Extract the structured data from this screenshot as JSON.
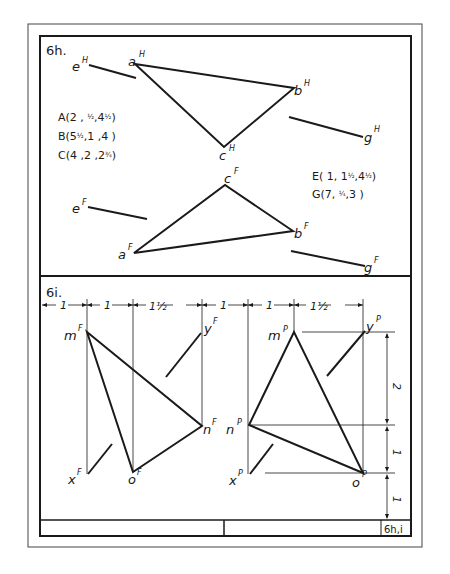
{
  "sheet": {
    "problem_6h": {
      "label": "6h.",
      "coordinates": [
        {
          "point": "A",
          "text": "A(2 , ",
          "frac1": "1/2",
          "mid": ",4",
          "frac2": "1/2",
          "end": ")"
        },
        {
          "point": "B",
          "text": "B(5",
          "frac1": "1/2",
          "mid": ",1  ,4  )",
          "frac2": "",
          "end": ""
        },
        {
          "point": "C",
          "text": "C(4 ,2 ,2",
          "frac1": "3/4",
          "mid": ")",
          "frac2": "",
          "end": ""
        },
        {
          "point": "E",
          "text": "E( 1, 1",
          "frac1": "1/2",
          "mid": ",4",
          "frac2": "1/2",
          "end": ")"
        },
        {
          "point": "G",
          "text": "G(7, ",
          "frac1": "1/4",
          "mid": ",3  )",
          "frac2": "",
          "end": ""
        }
      ],
      "horizontal_view_labels": {
        "a": "a",
        "b": "b",
        "c": "c",
        "e": "e",
        "g": "g",
        "sup": "H"
      },
      "frontal_view_labels": {
        "a": "a",
        "b": "b",
        "c": "c",
        "e": "e",
        "g": "g",
        "sup": "F"
      }
    },
    "problem_6i": {
      "label": "6i.",
      "horizontal_dimensions": [
        "1",
        "1",
        "1½",
        "1",
        "1",
        "1½"
      ],
      "vertical_dimensions": [
        "2",
        "1",
        "1"
      ],
      "frontal_view_labels": {
        "m": "m",
        "n": "n",
        "o": "o",
        "x": "x",
        "y": "y",
        "sup": "F"
      },
      "profile_view_labels": {
        "m": "m",
        "n": "n",
        "o": "o",
        "x": "x",
        "y": "y",
        "sup": "P"
      }
    },
    "title_block": {
      "cells": [
        "",
        "",
        "6h,i"
      ]
    },
    "colors": {
      "ink": "#1a1a1a",
      "paper": "#ffffff"
    }
  }
}
